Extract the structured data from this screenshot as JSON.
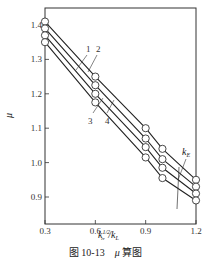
{
  "chart_data": {
    "type": "line",
    "title": "",
    "xlabel": "k_a^{1/2}/k_L",
    "ylabel": "μ",
    "xlim": [
      0.3,
      1.2
    ],
    "ylim": [
      0.82,
      1.45
    ],
    "x_ticks": [
      0.3,
      0.6,
      0.9,
      1.2
    ],
    "x_tick_labels": [
      "0.3",
      "0.6",
      "0.9",
      "1.2"
    ],
    "y_ticks": [
      0.9,
      1.0,
      1.1,
      1.2,
      1.3,
      1.4
    ],
    "y_tick_labels": [
      "0.9",
      "1.0",
      "1.1",
      "1.2",
      "1.3",
      "1.4"
    ],
    "grid": false,
    "marker": "open-circle",
    "annotation": "k_E",
    "series": [
      {
        "name": "1",
        "x": [
          0.3,
          0.6,
          0.9,
          1.0,
          1.2
        ],
        "values": [
          1.41,
          1.25,
          1.1,
          1.04,
          0.95
        ]
      },
      {
        "name": "2",
        "x": [
          0.3,
          0.6,
          0.9,
          1.0,
          1.2
        ],
        "values": [
          1.39,
          1.225,
          1.07,
          1.01,
          0.93
        ]
      },
      {
        "name": "3",
        "x": [
          0.3,
          0.6,
          0.9,
          1.0,
          1.2
        ],
        "values": [
          1.37,
          1.2,
          1.045,
          0.985,
          0.91
        ]
      },
      {
        "name": "4",
        "x": [
          0.3,
          0.6,
          0.9,
          1.0,
          1.2
        ],
        "values": [
          1.35,
          1.175,
          1.015,
          0.955,
          0.89
        ]
      }
    ]
  },
  "labels": {
    "y_axis": "μ",
    "x_axis_main": "k",
    "x_axis_sup": "1/2",
    "x_axis_sub": "α",
    "x_axis_rest": "/k",
    "x_axis_sub2": "L",
    "ke": "k",
    "ke_sub": "E"
  },
  "caption": {
    "figure": "图 10-13",
    "symbol": "μ",
    "text": "算图"
  }
}
